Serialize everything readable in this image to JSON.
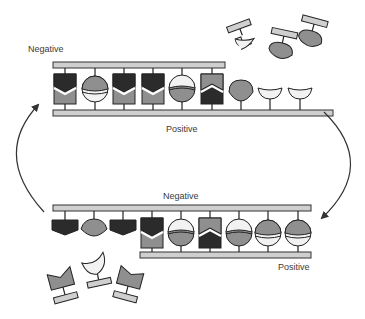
{
  "diagram": {
    "labels": {
      "top_negative": "Negative",
      "top_positive": "Positive",
      "bottom_negative": "Negative",
      "bottom_positive": "Positive"
    },
    "colors": {
      "dark": "#2b2b2b",
      "mid": "#8f8f8f",
      "light": "#f2f2f2",
      "rail_fill": "#cfcfcf",
      "stroke": "#222222",
      "arrow": "#333333"
    },
    "top_assembly": {
      "paired_units": [
        "chevron-dark-top",
        "sphere-mid-top",
        "chevron-dark-top",
        "chevron-dark-top",
        "sphere-light-top",
        "chevron-mid-top"
      ],
      "unpaired_bottom_units": [
        "lens-mid",
        "cup-light",
        "cup-light"
      ],
      "free_units": [
        "crescent-light",
        "lens-mid",
        "lens-mid"
      ]
    },
    "bottom_assembly": {
      "unpaired_top_units": [
        "pentagon-dark",
        "lens-mid",
        "pentagon-dark"
      ],
      "paired_units": [
        "chevron-dark-top",
        "sphere-mid-bottom",
        "chevron-mid-top",
        "sphere-mid-bottom",
        "sphere-mid-top",
        "sphere-mid-top"
      ],
      "free_units": [
        "notch-mid",
        "crescent-light",
        "notch-mid"
      ]
    },
    "arrows": [
      "left-cycle-arrow-up",
      "right-cycle-arrow-down"
    ]
  }
}
